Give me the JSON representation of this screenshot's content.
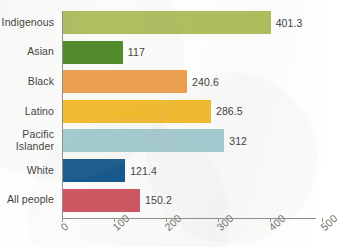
{
  "chart_data": {
    "type": "bar",
    "orientation": "horizontal",
    "title": "",
    "xlabel": "",
    "ylabel": "",
    "xlim": [
      0,
      500
    ],
    "grid": false,
    "legend": null,
    "xticks": [
      "0",
      "100",
      "200",
      "300",
      "400",
      "500"
    ],
    "xtick_values": [
      0,
      100,
      200,
      300,
      400,
      500
    ],
    "categories": [
      "Indigenous",
      "Asian",
      "Black",
      "Latino",
      "Pacific Islander",
      "White",
      "All people"
    ],
    "values": [
      401.3,
      117,
      240.6,
      286.5,
      312,
      121.4,
      150.2
    ],
    "value_labels": [
      "401.3",
      "117",
      "240.6",
      "286.5",
      "312",
      "121.4",
      "150.2"
    ],
    "colors": [
      "#aec05e",
      "#4d8a26",
      "#f0a04b",
      "#f4bc2a",
      "#a3cdd2",
      "#10558c",
      "#ce5360"
    ]
  },
  "top_cropped_text": "",
  "axis": {
    "line_color": "#8e8d88",
    "label_color": "#6f6e6a"
  },
  "text_color": "#3d3c39"
}
